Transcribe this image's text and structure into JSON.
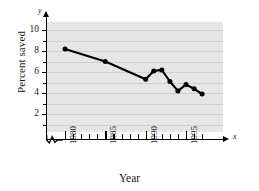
{
  "chart_data": {
    "type": "line",
    "title": "",
    "xlabel": "Year",
    "ylabel": "Percent saved",
    "x_axis_name": "x",
    "y_axis_name": "y",
    "x": [
      1980,
      1985,
      1990,
      1991,
      1992,
      1993,
      1994,
      1995,
      1996,
      1997
    ],
    "values": [
      8.2,
      7.0,
      5.3,
      6.1,
      6.2,
      5.1,
      4.2,
      4.8,
      4.4,
      3.9
    ],
    "xlim": [
      1979,
      1998
    ],
    "ylim": [
      0,
      10.8
    ],
    "x_tick_labels": [
      "1980",
      "1985",
      "1990",
      "1995"
    ],
    "x_tick_values": [
      1980,
      1985,
      1990,
      1995
    ],
    "x_minor_ticks": [
      1981,
      1982,
      1983,
      1984,
      1986,
      1987,
      1988,
      1989,
      1991,
      1992,
      1993,
      1994,
      1996,
      1997
    ],
    "y_tick_labels": [
      "2",
      "4",
      "6",
      "8",
      "10"
    ],
    "y_tick_values": [
      2,
      4,
      6,
      8,
      10
    ],
    "y_minor_ticks": [
      1,
      3,
      5,
      7,
      9
    ],
    "grid": true,
    "legend": false,
    "axis_break": true,
    "marker": "filled-circle",
    "line_color": "#000000",
    "marker_color": "#000000",
    "panel_color": "#e6e6e6",
    "grid_color": "#cfcfcf"
  }
}
